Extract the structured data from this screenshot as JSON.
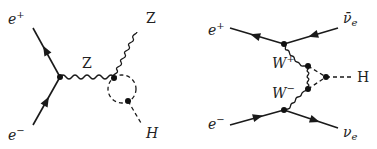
{
  "figure": {
    "diagrams": [
      {
        "id": "higgsstrahlung-loop",
        "labels": {
          "positron_in": {
            "base": "e",
            "sup": "+"
          },
          "electron_in": {
            "base": "e",
            "sup": "−"
          },
          "propagator": "Z",
          "boson_out": "Z",
          "higgs_out": "H"
        }
      },
      {
        "id": "ww-fusion-loop",
        "labels": {
          "positron_in": {
            "base": "e",
            "sup": "+"
          },
          "electron_in": {
            "base": "e",
            "sup": "−"
          },
          "antineutrino_out": {
            "base": "ν̄",
            "sub": "e"
          },
          "neutrino_out": {
            "base": "ν",
            "sub": "e"
          },
          "w_plus": {
            "base": "W",
            "sup": "+"
          },
          "w_minus": {
            "base": "W",
            "sup": "−"
          },
          "higgs_out": "H"
        }
      }
    ],
    "colors": {
      "line": "#1a1a1a",
      "text": "#222222",
      "background": "#ffffff"
    }
  }
}
